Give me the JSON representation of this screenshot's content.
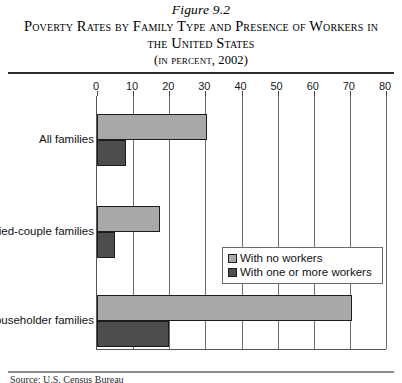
{
  "figure": {
    "number": "Figure 9.2",
    "title": "Poverty Rates by Family Type and Presence of Workers in the United States",
    "subtitle": "(in percent, 2002)",
    "source": "Source: U.S. Census Bureau"
  },
  "chart_data": {
    "type": "bar",
    "orientation": "horizontal",
    "title": "Poverty Rates by Family Type and Presence of Workers in the United States",
    "subtitle": "(in percent, 2002)",
    "xlabel": "",
    "ylabel": "",
    "xlim": [
      0,
      80
    ],
    "xticks": [
      0,
      10,
      20,
      30,
      40,
      50,
      60,
      70,
      80
    ],
    "grid": true,
    "legend_position": "middle-right",
    "categories": [
      "All families",
      "In married-couple families",
      "In female-householder families"
    ],
    "series": [
      {
        "name": "With no workers",
        "color": "#a8a8a8",
        "values": [
          30.5,
          17.5,
          70.5
        ]
      },
      {
        "name": "With one or more workers",
        "color": "#4d4d4d",
        "values": [
          8.0,
          5.0,
          20.0
        ]
      }
    ]
  },
  "legend": {
    "items": [
      {
        "label": "With no workers"
      },
      {
        "label": "With one or more workers"
      }
    ]
  }
}
